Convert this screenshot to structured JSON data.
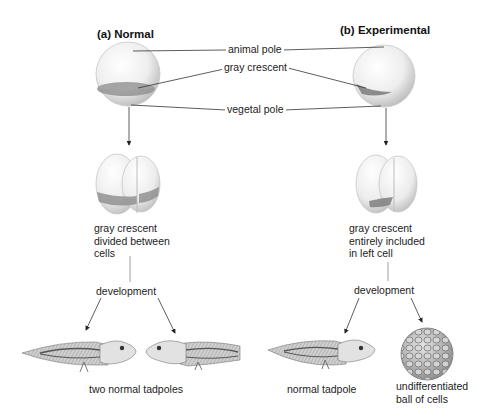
{
  "panels": {
    "normal": {
      "heading": "(a) Normal",
      "cleavage_caption": [
        "gray crescent",
        "divided between",
        "cells"
      ],
      "development_label": "development",
      "result_caption": "two normal tadpoles"
    },
    "experimental": {
      "heading": "(b) Experimental",
      "cleavage_caption": [
        "gray crescent",
        "entirely included",
        "in left cell"
      ],
      "development_label": "development",
      "result_left_caption": "normal tadpole",
      "result_right_caption": [
        "undifferentiated",
        "ball of cells"
      ]
    }
  },
  "center_labels": {
    "animal_pole": "animal pole",
    "gray_crescent": "gray crescent",
    "vegetal_pole": "vegetal pole"
  },
  "colors": {
    "line": "#333333",
    "egg_light": "#f4f4f4",
    "egg_shadow": "#bdbdbd",
    "crescent": "#8a8a8a"
  }
}
